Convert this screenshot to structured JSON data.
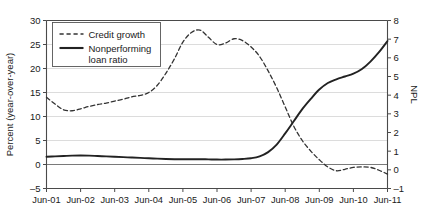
{
  "chart_data": {
    "type": "line",
    "title": "",
    "xlabel": "",
    "ylabel": "Percent (year-over-year)",
    "y2label": "NPL",
    "grid": true,
    "legend_position": "top-left",
    "xlim": [
      2001.5,
      2011.5
    ],
    "ylim": [
      -5,
      30
    ],
    "y2lim": [
      -1,
      8
    ],
    "yticks": [
      30,
      25,
      20,
      15,
      10,
      5,
      0,
      -5
    ],
    "ytick_labels": [
      "30",
      "25",
      "20",
      "15",
      "10",
      "5",
      "0",
      "–5"
    ],
    "y2ticks": [
      8,
      7,
      6,
      5,
      4,
      3,
      2,
      1,
      0,
      -1
    ],
    "y2tick_labels": [
      "8",
      "7",
      "6",
      "5",
      "4",
      "3",
      "2",
      "1",
      "0",
      "–1"
    ],
    "xticks": [
      2001.5,
      2002.5,
      2003.5,
      2004.5,
      2005.5,
      2006.5,
      2007.5,
      2008.5,
      2009.5,
      2010.5,
      2011.5
    ],
    "xtick_labels": [
      "Jun-01",
      "Jun-02",
      "Jun-03",
      "Jun-04",
      "Jun-05",
      "Jun-06",
      "Jun-07",
      "Jun-08",
      "Jun-09",
      "Jun-10",
      "Jun-11"
    ],
    "series": [
      {
        "name": "Credit growth",
        "axis": "left",
        "style": "dashed",
        "color": "#333333",
        "x": [
          2001.5,
          2001.75,
          2002.0,
          2002.25,
          2002.5,
          2002.75,
          2003.0,
          2003.25,
          2003.5,
          2003.75,
          2004.0,
          2004.25,
          2004.5,
          2004.75,
          2005.0,
          2005.25,
          2005.5,
          2005.75,
          2006.0,
          2006.25,
          2006.5,
          2006.75,
          2007.0,
          2007.25,
          2007.5,
          2007.75,
          2008.0,
          2008.25,
          2008.5,
          2008.75,
          2009.0,
          2009.25,
          2009.5,
          2009.75,
          2010.0,
          2010.25,
          2010.5,
          2010.75,
          2011.0,
          2011.25,
          2011.5
        ],
        "values": [
          14.0,
          12.6,
          11.4,
          11.2,
          11.6,
          12.1,
          12.5,
          12.8,
          13.2,
          13.6,
          14.1,
          14.4,
          15.0,
          16.5,
          19.0,
          22.0,
          25.5,
          27.5,
          28.0,
          26.5,
          25.0,
          25.3,
          26.2,
          25.8,
          24.5,
          22.5,
          19.5,
          16.0,
          12.0,
          8.0,
          5.0,
          2.8,
          1.0,
          -0.5,
          -1.3,
          -1.0,
          -0.6,
          -0.5,
          -0.6,
          -1.2,
          -2.0
        ]
      },
      {
        "name": "Nonperforming loan ratio",
        "axis": "right",
        "style": "solid",
        "color": "#222222",
        "x": [
          2001.5,
          2001.75,
          2002.0,
          2002.25,
          2002.5,
          2002.75,
          2003.0,
          2003.25,
          2003.5,
          2003.75,
          2004.0,
          2004.25,
          2004.5,
          2004.75,
          2005.0,
          2005.25,
          2005.5,
          2005.75,
          2006.0,
          2006.25,
          2006.5,
          2006.75,
          2007.0,
          2007.25,
          2007.5,
          2007.75,
          2008.0,
          2008.25,
          2008.5,
          2008.75,
          2009.0,
          2009.25,
          2009.5,
          2009.75,
          2010.0,
          2010.25,
          2010.5,
          2010.75,
          2011.0,
          2011.25,
          2011.5
        ],
        "values": [
          0.7,
          0.72,
          0.74,
          0.76,
          0.77,
          0.76,
          0.74,
          0.72,
          0.7,
          0.68,
          0.66,
          0.64,
          0.62,
          0.6,
          0.58,
          0.57,
          0.57,
          0.57,
          0.57,
          0.56,
          0.55,
          0.55,
          0.56,
          0.58,
          0.62,
          0.72,
          0.95,
          1.35,
          1.95,
          2.6,
          3.25,
          3.8,
          4.3,
          4.65,
          4.85,
          5.0,
          5.15,
          5.4,
          5.8,
          6.3,
          6.9
        ]
      }
    ],
    "legend": [
      {
        "label": "Credit growth",
        "style": "dashed"
      },
      {
        "label": "Nonperforming",
        "label2": "loan ratio",
        "style": "solid"
      }
    ]
  }
}
